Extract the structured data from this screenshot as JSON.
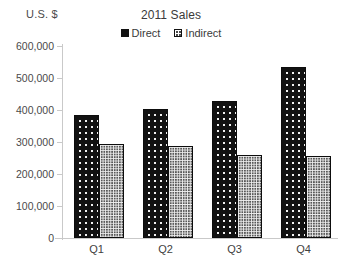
{
  "chart_data": {
    "type": "bar",
    "title": "2011 Sales",
    "xlabel": "",
    "ylabel": "U.S. $",
    "categories": [
      "Q1",
      "Q2",
      "Q3",
      "Q4"
    ],
    "series": [
      {
        "name": "Direct",
        "values": [
          385000,
          404000,
          428000,
          535000
        ]
      },
      {
        "name": "Indirect",
        "values": [
          294000,
          288000,
          260000,
          257000
        ]
      }
    ],
    "ylim": [
      0,
      600000
    ],
    "y_ticks": [
      0,
      100000,
      200000,
      300000,
      400000,
      500000,
      600000
    ],
    "y_tick_labels": [
      "0",
      "100,000",
      "200,000",
      "300,000",
      "400,000",
      "500,000",
      "600,000"
    ],
    "grid": false,
    "legend_position": "top-center",
    "colors": {
      "direct": "#121212",
      "indirect": "#585858",
      "axis": "#c9c9c9",
      "text": "#3b3b3b",
      "background": "#ffffff"
    }
  },
  "legend": {
    "items": [
      {
        "label": "Direct",
        "swatch": "direct-swatch-icon"
      },
      {
        "label": "Indirect",
        "swatch": "indirect-swatch-icon"
      }
    ]
  }
}
